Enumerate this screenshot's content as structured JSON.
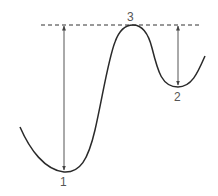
{
  "diagram": {
    "type": "energy-landscape",
    "colors": {
      "curve": "#2a2a2a",
      "arrow": "#555555",
      "dashed": "#333333",
      "label": "#555555"
    },
    "reference_line": {
      "style": "dashed",
      "y": 25,
      "x_start": 41,
      "x_end": 202
    },
    "points": [
      {
        "id": "1",
        "label": "1",
        "role": "global-minimum",
        "x": 64,
        "y": 172
      },
      {
        "id": "2",
        "label": "2",
        "role": "local-minimum",
        "x": 178,
        "y": 87
      },
      {
        "id": "3",
        "label": "3",
        "role": "maximum",
        "x": 133,
        "y": 25
      }
    ],
    "arrows": [
      {
        "from": "reference_line",
        "to": "1",
        "x": 64,
        "y_top": 25,
        "y_bottom": 171,
        "double_headed": true
      },
      {
        "from": "reference_line",
        "to": "2",
        "x": 178,
        "y_top": 25,
        "y_bottom": 86,
        "double_headed": true
      }
    ]
  }
}
